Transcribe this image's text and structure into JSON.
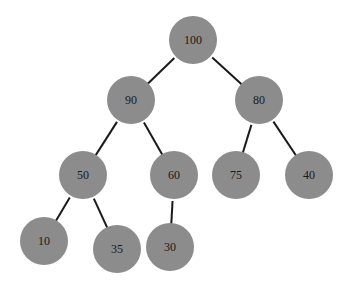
{
  "tree": {
    "type": "binary-tree",
    "node_color": "#8c8c8c",
    "edge_color": "#1a1a1a",
    "radius": 24,
    "nodes": [
      {
        "id": "n100",
        "label": "100",
        "x": 193,
        "y": 40
      },
      {
        "id": "n90",
        "label": "90",
        "x": 131,
        "y": 100
      },
      {
        "id": "n80",
        "label": "80",
        "x": 259,
        "y": 100
      },
      {
        "id": "n50",
        "label": "50",
        "x": 83,
        "y": 175
      },
      {
        "id": "n60",
        "label": "60",
        "x": 174,
        "y": 175
      },
      {
        "id": "n75",
        "label": "75",
        "x": 236,
        "y": 175
      },
      {
        "id": "n40",
        "label": "40",
        "x": 309,
        "y": 175
      },
      {
        "id": "n10",
        "label": "10",
        "x": 44,
        "y": 241
      },
      {
        "id": "n35",
        "label": "35",
        "x": 117,
        "y": 249
      },
      {
        "id": "n30",
        "label": "30",
        "x": 170,
        "y": 247
      }
    ],
    "edges": [
      [
        "n100",
        "n90"
      ],
      [
        "n100",
        "n80"
      ],
      [
        "n90",
        "n50"
      ],
      [
        "n90",
        "n60"
      ],
      [
        "n80",
        "n75"
      ],
      [
        "n80",
        "n40"
      ],
      [
        "n50",
        "n10"
      ],
      [
        "n50",
        "n35"
      ],
      [
        "n60",
        "n30"
      ]
    ]
  }
}
